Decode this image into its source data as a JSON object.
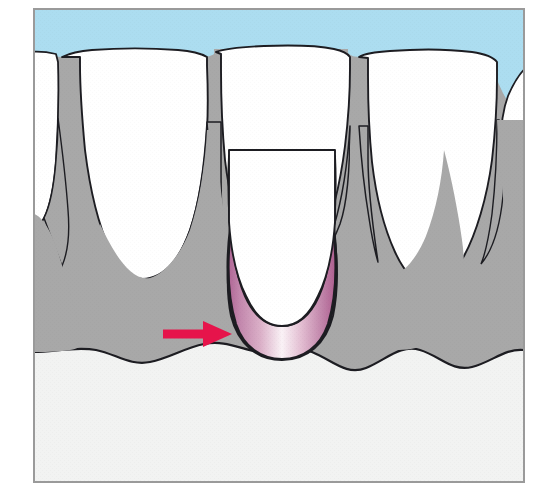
{
  "figure": {
    "kind": "medical-illustration",
    "width": 545,
    "height": 494,
    "frame": {
      "x": 33,
      "y": 8,
      "width": 492,
      "height": 475,
      "border_color": "#9a9a9a",
      "page_background": "#ffffff"
    }
  },
  "colors": {
    "oral_cavity_blue": "#ACDDF0",
    "tooth_enamel_white": "#FFFFFF",
    "gingiva_gray": "#A8A8A8",
    "bone_offwhite": "#F2F3F2",
    "outline_dark": "#1D1D22",
    "pocket_pink_dark": "#B8679A",
    "pocket_pink_mid": "#D9A3C0",
    "pocket_pink_light": "#FBF3F7",
    "arrow_red": "#E6144B"
  },
  "regions": [
    {
      "name": "oral-cavity",
      "label": "Oral cavity (blue field above teeth)",
      "color": "#ACDDF0"
    },
    {
      "name": "teeth",
      "label": "Teeth (crowns and roots)",
      "color": "#FFFFFF",
      "count": 5
    },
    {
      "name": "gingiva",
      "label": "Gingiva / soft tissue",
      "color": "#A8A8A8"
    },
    {
      "name": "alveolar-bone",
      "label": "Alveolar bone",
      "color": "#F2F3F2"
    },
    {
      "name": "periodontal-pocket",
      "label": "Periodontal pocket lesion",
      "color": "#D9A3C0"
    }
  ],
  "annotations": {
    "arrow": {
      "name": "pointer-arrow",
      "color": "#E6144B",
      "direction": "right",
      "shaft": {
        "x1": 163,
        "y1": 334,
        "x2": 207,
        "y2": 334,
        "thickness": 9
      },
      "head": {
        "tip_x": 232,
        "tip_y": 334,
        "base_x": 203,
        "half_height": 13
      },
      "points_to": "periodontal-pocket"
    }
  },
  "geometry": {
    "gum_line_y": 57,
    "bone_line_y": 352,
    "pocket_depth_y": 345,
    "teeth": [
      {
        "name": "tooth-partial-left",
        "crown_left": 33,
        "crown_right": 60,
        "apex_x": 40,
        "apex_y": 215
      },
      {
        "name": "tooth-left",
        "crown_left": 60,
        "crown_right": 205,
        "apex_x": 133,
        "apex_y": 272
      },
      {
        "name": "tooth-center",
        "crown_left": 214,
        "crown_right": 348,
        "apex_x": 283,
        "apex_y": 276
      },
      {
        "name": "tooth-right",
        "crown_left": 357,
        "crown_right": 495,
        "apex_x": 428,
        "apex_y": 270
      },
      {
        "name": "tooth-partial-right",
        "crown_left": 500,
        "crown_right": 525,
        "apex_x": 520,
        "apex_y": 225
      }
    ],
    "bone_wave_peaks_y": [
      350,
      366,
      347,
      370,
      349,
      372,
      350
    ]
  }
}
